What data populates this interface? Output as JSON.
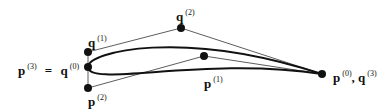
{
  "diagram": {
    "type": "bezier-airfoil",
    "points": {
      "p0_q3": {
        "x": 322,
        "y": 74
      },
      "p1": {
        "x": 204,
        "y": 56
      },
      "p2": {
        "x": 88,
        "y": 88
      },
      "p3_q0": {
        "x": 88,
        "y": 67
      },
      "q1": {
        "x": 88,
        "y": 52
      },
      "q2": {
        "x": 181,
        "y": 28
      }
    },
    "labels": {
      "p3_eq_q0": {
        "base1": "p",
        "sup1": "(3)",
        "eq": "=",
        "base2": "q",
        "sup2": "(0)"
      },
      "q1": {
        "base": "q",
        "sup": "(1)"
      },
      "q2": {
        "base": "q",
        "sup": "(2)"
      },
      "p1": {
        "base": "p",
        "sup": "(1)"
      },
      "p2": {
        "base": "p",
        "sup": "(2)"
      },
      "p0_q3": {
        "base1": "p",
        "sup1": "(0)",
        "sep": ",",
        "base2": "q",
        "sup2": "(3)"
      }
    }
  }
}
